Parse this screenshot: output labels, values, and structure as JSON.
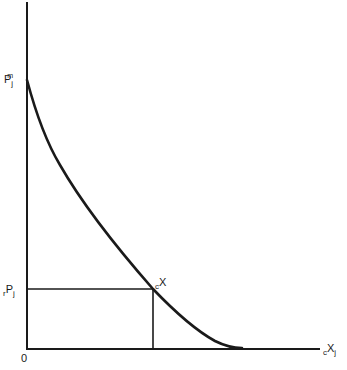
{
  "diagram": {
    "type": "demand-curve",
    "colors": {
      "ink": "#1a1a1a",
      "background": "#ffffff"
    },
    "y_axis": {
      "labels": {
        "pm": {
          "main": "P",
          "sup": "m",
          "sub": "j"
        },
        "rp": {
          "pre": "r",
          "main": "P",
          "sub": "j"
        }
      }
    },
    "x_axis": {
      "label": {
        "pre": "c",
        "main": "X",
        "sub": "j"
      }
    },
    "origin_label": "0",
    "point_label": {
      "pre": "c",
      "main": "X"
    },
    "curve": {
      "description": "convex downward-sloping curve from P_j^m on the vertical axis to the horizontal axis",
      "start": [
        27,
        80
      ],
      "end": [
        240,
        348
      ]
    }
  }
}
